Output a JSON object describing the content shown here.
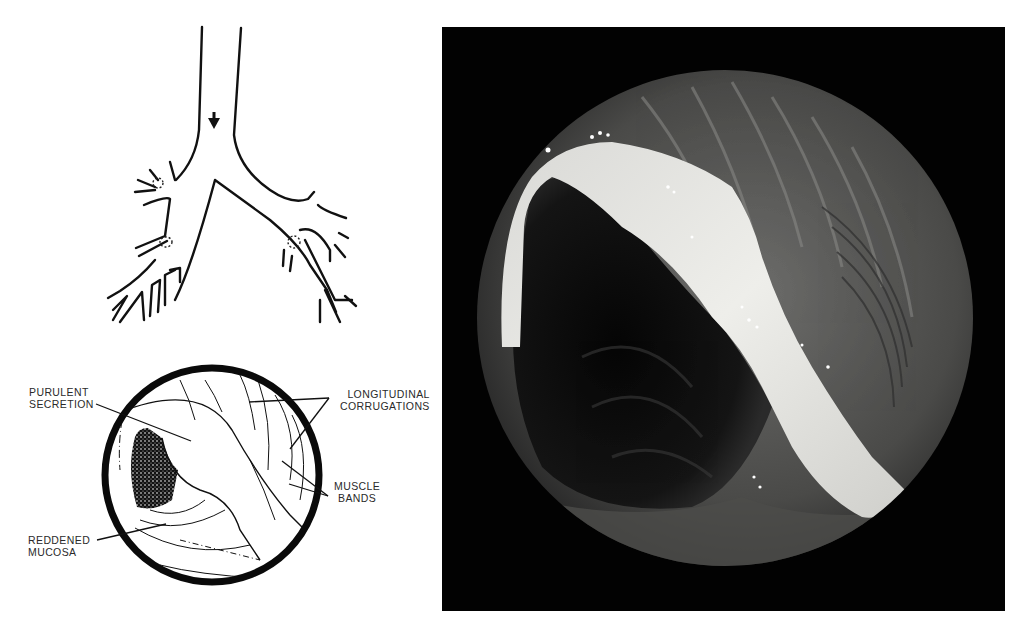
{
  "figure": {
    "panels": [
      {
        "id": "airway-diagram",
        "description": "Tracheobronchial tree line drawing with arrow indicating viewing direction and dotted circles marking lesion sites"
      },
      {
        "id": "endoscopic-diagram",
        "description": "Labelled line drawing of the bronchoscopic view"
      },
      {
        "id": "endoscopic-photo",
        "description": "Bronchoscopic photograph showing purulent secretion across airway lumen"
      }
    ],
    "labels": {
      "purulent_secretion": [
        "PURULENT",
        "SECRETION"
      ],
      "longitudinal_corrugations": [
        "LONGITUDINAL",
        "CORRUGATIONS"
      ],
      "muscle_bands": [
        "MUSCLE",
        "BANDS"
      ],
      "reddened_mucosa": [
        "REDDENED",
        "MUCOSA"
      ]
    },
    "colors": {
      "line": "#111111",
      "background": "#ffffff",
      "photo_frame": "#020202",
      "secretion": "#e4e4e0",
      "mucosa": "#5a5a5a"
    }
  }
}
